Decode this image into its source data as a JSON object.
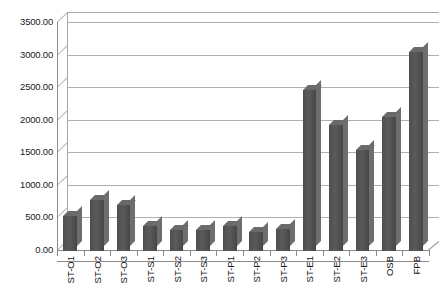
{
  "chart_data": {
    "type": "bar",
    "title": "",
    "subtitle": "",
    "xlabel": "",
    "ylabel": "",
    "ylim": [
      0,
      3500
    ],
    "ytick_step": 500,
    "grid": true,
    "legend": "none",
    "style": "3d-column",
    "bar_color": "#545454",
    "gridline_color": "#b0b0b0",
    "axis_color": "#8a8a8a",
    "categories": [
      "ST-O1",
      "ST-O2",
      "ST-O3",
      "ST-S1",
      "ST-S2",
      "ST-S3",
      "ST-P1",
      "ST-P2",
      "ST-P3",
      "ST-E1",
      "ST-E2",
      "ST-E3",
      "OSB",
      "FPB"
    ],
    "values": [
      540,
      780,
      700,
      380,
      330,
      330,
      390,
      290,
      340,
      2470,
      1930,
      1550,
      2060,
      3050
    ],
    "ytick_labels": [
      "0.00",
      "500.00",
      "1000.00",
      "1500.00",
      "2000.00",
      "2500.00",
      "3000.00",
      "3500.00"
    ],
    "ytick_values": [
      0,
      500,
      1000,
      1500,
      2000,
      2500,
      3000,
      3500
    ]
  }
}
